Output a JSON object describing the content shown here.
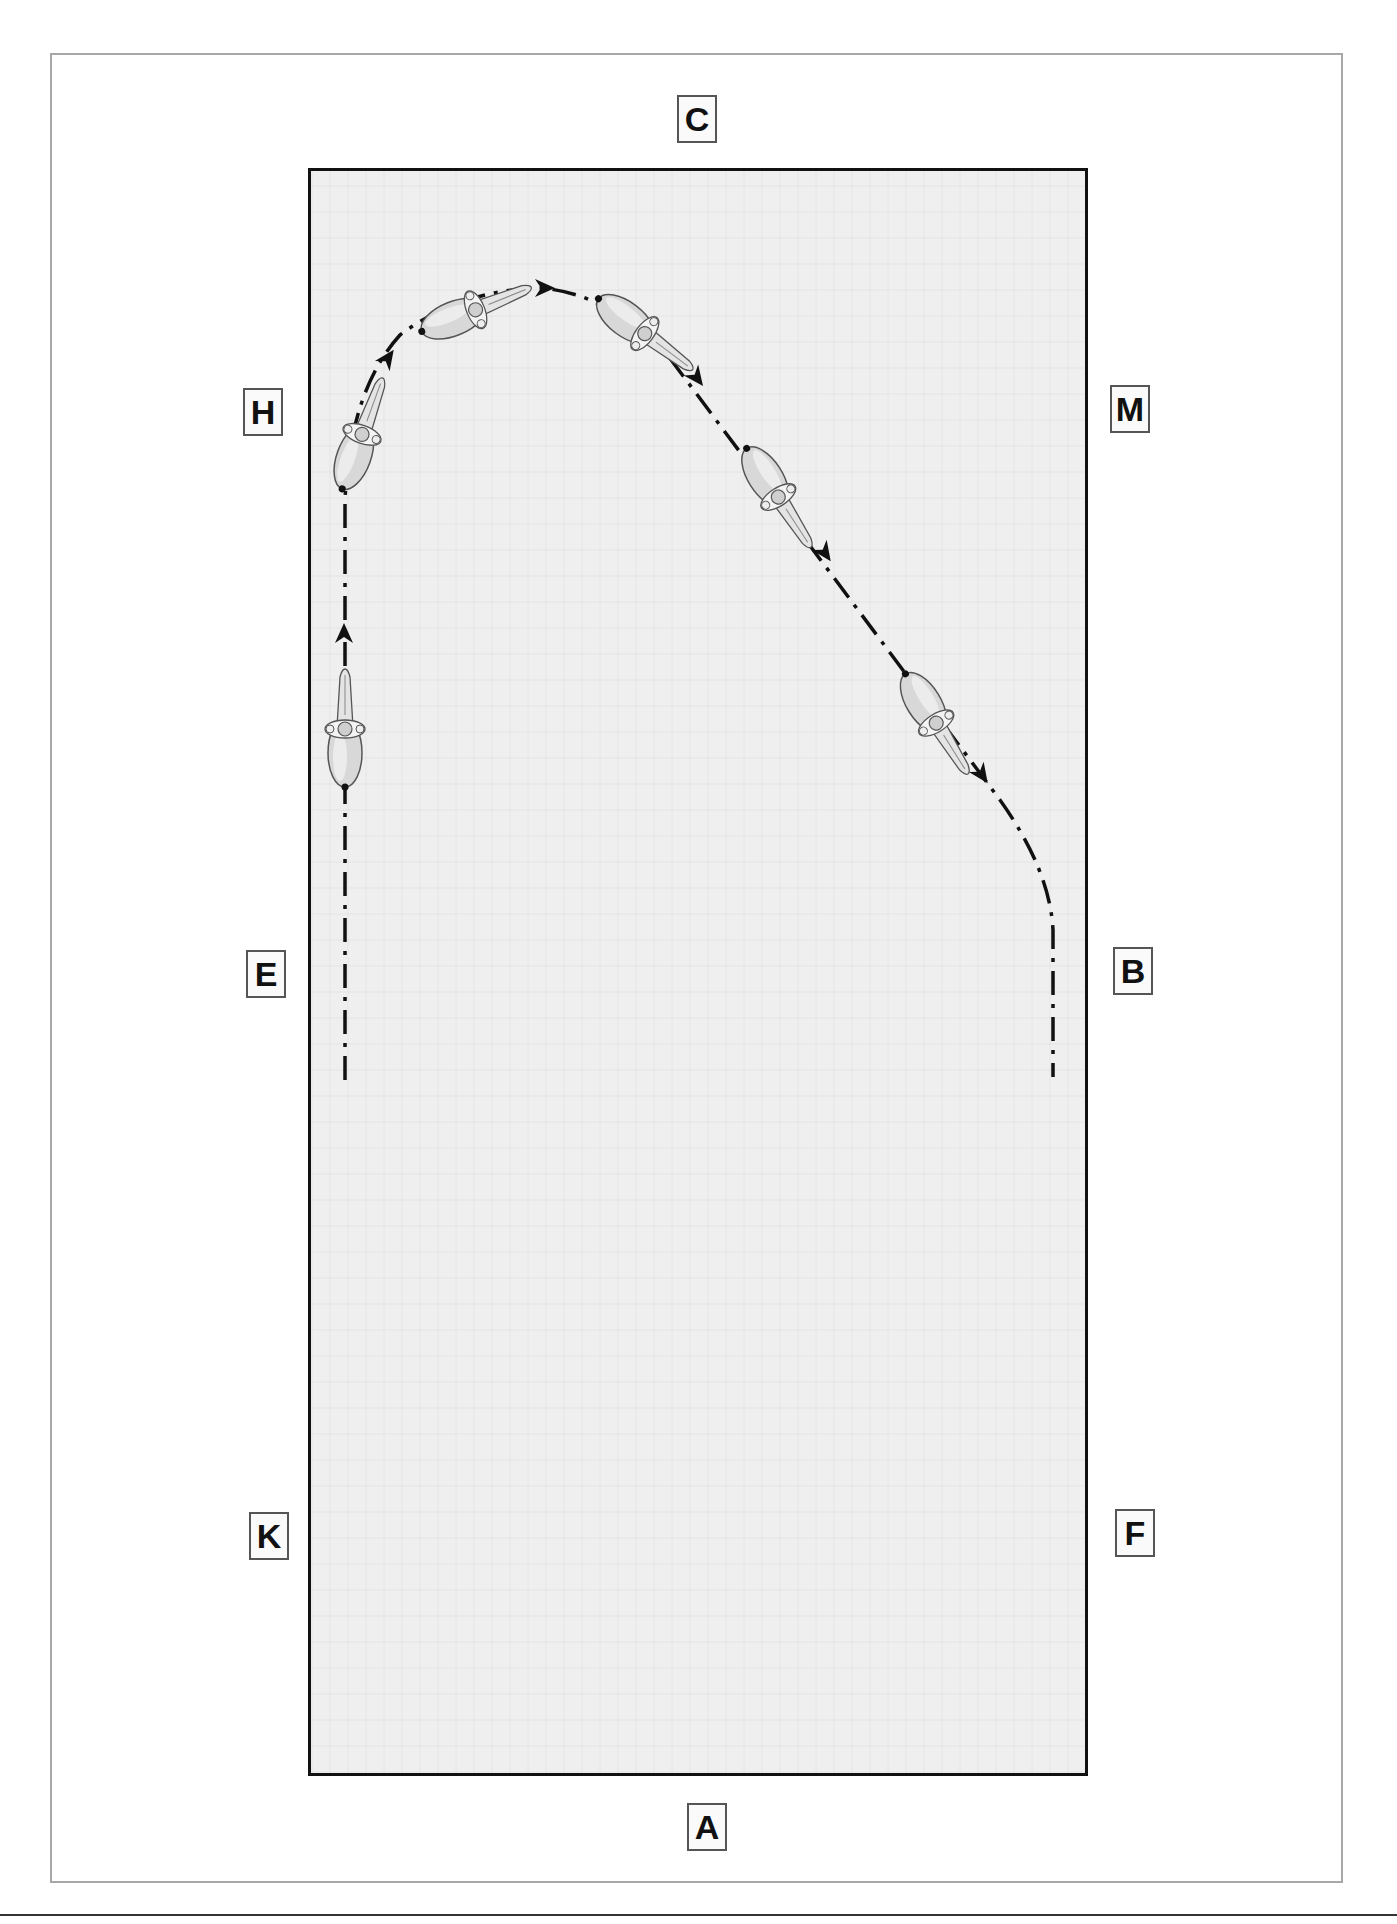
{
  "diagram": {
    "type": "dressage-arena-figure",
    "colors": {
      "arena_fill": "#efefef",
      "arena_border": "#111111",
      "frame_border": "#a8a8a8",
      "track_line": "#111111",
      "horse_fill": "#dcdcdc"
    },
    "markers": [
      {
        "id": "C",
        "label": "C",
        "x": 677,
        "y": 95
      },
      {
        "id": "H",
        "label": "H",
        "x": 243,
        "y": 388
      },
      {
        "id": "M",
        "label": "M",
        "x": 1110,
        "y": 385
      },
      {
        "id": "E",
        "label": "E",
        "x": 246,
        "y": 950
      },
      {
        "id": "B",
        "label": "B",
        "x": 1113,
        "y": 947
      },
      {
        "id": "K",
        "label": "K",
        "x": 249,
        "y": 1512
      },
      {
        "id": "F",
        "label": "F",
        "x": 1115,
        "y": 1509
      },
      {
        "id": "A",
        "label": "A",
        "x": 687,
        "y": 1803
      }
    ],
    "track": {
      "style": "dash-dot",
      "path": "M345,1080 L345,500 Q350,390 400,335 Q460,290 540,288 Q600,292 660,345 L1000,800 Q1050,870 1053,930 L1053,1077",
      "arrows": [
        {
          "x": 344,
          "y": 633,
          "angle": -90
        },
        {
          "x": 388,
          "y": 358,
          "angle": -55
        },
        {
          "x": 545,
          "y": 288,
          "angle": 0
        },
        {
          "x": 697,
          "y": 378,
          "angle": 53
        },
        {
          "x": 825,
          "y": 553,
          "angle": 55
        },
        {
          "x": 982,
          "y": 775,
          "angle": 55
        }
      ]
    },
    "horses": [
      {
        "cx": 345,
        "cy": 735,
        "angle": -90
      },
      {
        "cx": 360,
        "cy": 440,
        "angle": -70
      },
      {
        "cx": 470,
        "cy": 312,
        "angle": -22
      },
      {
        "cx": 640,
        "cy": 330,
        "angle": 37
      },
      {
        "cx": 775,
        "cy": 492,
        "angle": 57
      },
      {
        "cx": 933,
        "cy": 718,
        "angle": 58
      }
    ]
  }
}
